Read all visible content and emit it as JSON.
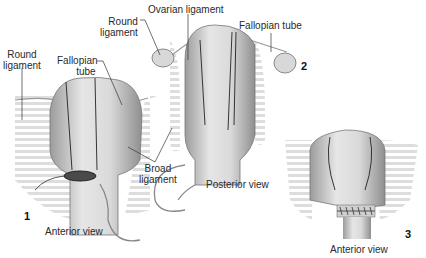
{
  "figure": {
    "type": "surgical illustration",
    "panels": [
      {
        "number": "1",
        "view": "Anterior view"
      },
      {
        "number": "2",
        "view": "Posterior view"
      },
      {
        "number": "3",
        "view": "Anterior view"
      }
    ],
    "labels": {
      "round_ligament_left": [
        "Round",
        "ligament"
      ],
      "fallopian_tube_left": [
        "Fallopian",
        "tube"
      ],
      "round_ligament_mid": [
        "Round",
        "ligament"
      ],
      "ovarian_ligament": "Ovarian ligament",
      "fallopian_tube_right": "Fallopian tube",
      "broad_ligament": [
        "Broad",
        "ligament"
      ]
    },
    "colors": {
      "tissue": "#d9d9d9",
      "tissue_shadow": "#a9a9a9",
      "outline": "#333333",
      "suture": "#666666"
    }
  }
}
